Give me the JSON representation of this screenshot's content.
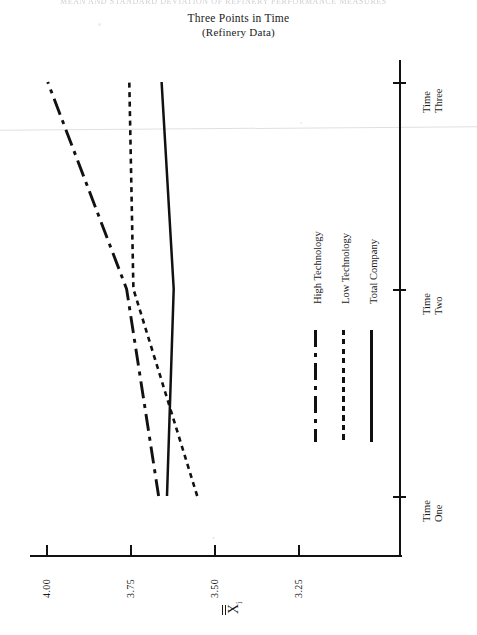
{
  "scan": {
    "header_text": "MEAN AND STANDARD DEVIATION OF REFINERY PERFORMANCE MEASURES"
  },
  "figure": {
    "title_line1": "Three Points in Time",
    "title_line2": "(Refinery Data)",
    "value_axis_label": "X",
    "value_axis_label_subscript": "i"
  },
  "value_axis": {
    "ticks": [
      "4.00",
      "3.75",
      "3.50",
      "3.25"
    ],
    "tick_values": [
      4.0,
      3.75,
      3.5,
      3.25
    ],
    "min": 3.25,
    "max": 4.0
  },
  "time_axis": {
    "ticks": [
      {
        "line1": "Time",
        "line2": "One"
      },
      {
        "line1": "Time",
        "line2": "Two"
      },
      {
        "line1": "Time",
        "line2": "Three"
      }
    ]
  },
  "legend": {
    "items": [
      {
        "label": "High Technology",
        "style": "dash-dot",
        "color": "#111111"
      },
      {
        "label": "Low Technology",
        "style": "dashed",
        "color": "#111111"
      },
      {
        "label": "Total Company",
        "style": "solid",
        "color": "#111111"
      }
    ]
  },
  "chart_data": {
    "type": "line",
    "title": "Three Points in Time (Refinery Data)",
    "orientation": "horizontal-value-axis",
    "xlabel": "X̅̅i",
    "ylabel": "",
    "categories": [
      "Time One",
      "Time Two",
      "Time Three"
    ],
    "xlim": [
      3.25,
      4.0
    ],
    "grid": false,
    "legend_position": "center-right",
    "series": [
      {
        "name": "High Technology",
        "style": "dash-dot",
        "values": [
          3.665,
          3.76,
          3.995
        ]
      },
      {
        "name": "Low Technology",
        "style": "dashed",
        "values": [
          3.55,
          3.74,
          3.752
        ]
      },
      {
        "name": "Total Company",
        "style": "solid",
        "values": [
          3.64,
          3.62,
          3.656
        ]
      }
    ]
  }
}
